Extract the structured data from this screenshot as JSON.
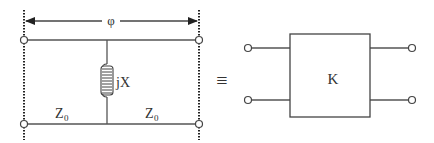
{
  "diagram": {
    "left_circuit": {
      "phase_label": "φ",
      "reactance_label": "jX",
      "line_left_label": "Z",
      "line_left_subscript": "0",
      "line_right_label": "Z",
      "line_right_subscript": "0",
      "element": "shunt-inductor"
    },
    "equivalence_symbol": "≡",
    "right_circuit": {
      "box_label": "K",
      "ports": 2
    },
    "colors": {
      "line": "#555555",
      "text": "#333333",
      "background": "#ffffff"
    }
  }
}
